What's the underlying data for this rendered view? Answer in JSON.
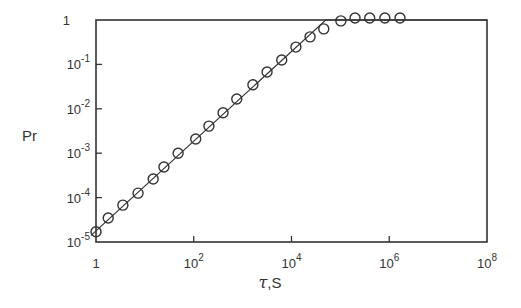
{
  "chart_data": {
    "type": "scatter",
    "title": "",
    "xlabel": "τ, S",
    "ylabel": "Pr",
    "xscale": "log",
    "yscale": "log",
    "xlim": [
      1,
      100000000
    ],
    "ylim": [
      1e-05,
      1
    ],
    "grid": false,
    "legend": null,
    "x_ticks": [
      {
        "exp": 0,
        "label": "1"
      },
      {
        "exp": 2,
        "label": "10",
        "sup": "2"
      },
      {
        "exp": 4,
        "label": "10",
        "sup": "4"
      },
      {
        "exp": 6,
        "label": "10",
        "sup": "6"
      },
      {
        "exp": 8,
        "label": "10",
        "sup": "8"
      }
    ],
    "y_ticks": [
      {
        "exp": 0,
        "label": "1"
      },
      {
        "exp": -1,
        "label": "10",
        "sup": "-1"
      },
      {
        "exp": -2,
        "label": "10",
        "sup": "-2"
      },
      {
        "exp": -3,
        "label": "10",
        "sup": "-3"
      },
      {
        "exp": -4,
        "label": "10",
        "sup": "-4"
      },
      {
        "exp": -5,
        "label": "10",
        "sup": "-5"
      }
    ],
    "series": [
      {
        "name": "measured",
        "marker": "open-circle",
        "log10_x": [
          0.0,
          0.25,
          0.55,
          0.86,
          1.17,
          1.39,
          1.68,
          2.04,
          2.31,
          2.6,
          2.88,
          3.21,
          3.5,
          3.8,
          4.09,
          4.38,
          4.66,
          5.01,
          5.3,
          5.6,
          5.91,
          6.22
        ],
        "log10_y": [
          -4.77,
          -4.46,
          -4.17,
          -3.9,
          -3.58,
          -3.31,
          -3.0,
          -2.68,
          -2.39,
          -2.09,
          -1.78,
          -1.46,
          -1.17,
          -0.9,
          -0.61,
          -0.38,
          -0.2,
          -0.02,
          0.0,
          0.0,
          0.0,
          0.0
        ],
        "x": [
          1,
          1.8,
          3.5,
          7.2,
          15,
          25,
          48,
          110,
          200,
          400,
          760,
          1600,
          3200,
          6300,
          12000,
          24000,
          46000,
          100000,
          200000,
          400000,
          810000,
          1660000
        ],
        "y": [
          1.7e-05,
          3.5e-05,
          6.8e-05,
          0.00013,
          0.00026,
          0.00049,
          0.001,
          0.0021,
          0.0041,
          0.0081,
          0.017,
          0.035,
          0.068,
          0.13,
          0.25,
          0.42,
          0.63,
          0.95,
          1,
          1,
          1,
          1
        ]
      },
      {
        "name": "fit",
        "style": "line",
        "log10_x": [
          -0.1,
          4.7,
          8.0
        ],
        "log10_y": [
          -4.85,
          0.0,
          0.0
        ]
      }
    ]
  },
  "axis": {
    "xlabel_tau": "τ",
    "xlabel_rest": ",S",
    "ylabel": "Pr"
  }
}
